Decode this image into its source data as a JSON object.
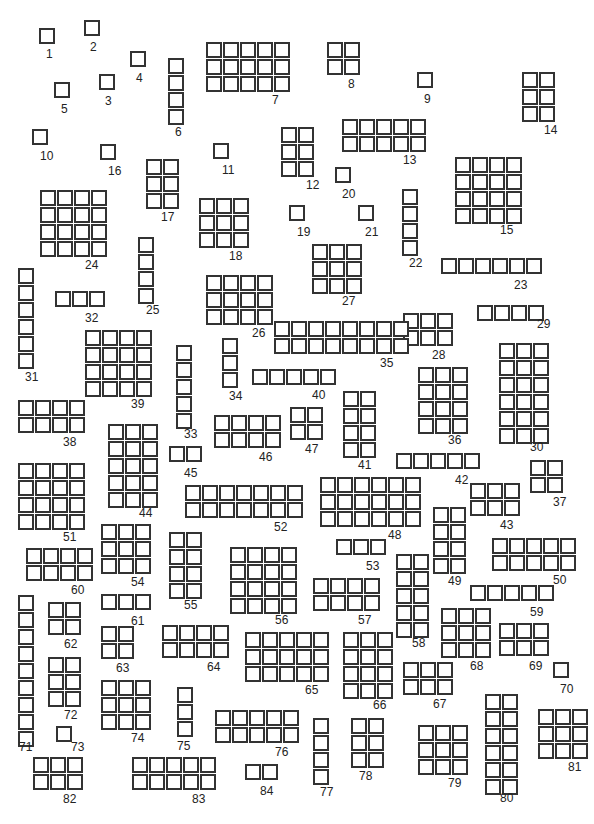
{
  "diagram": {
    "title": "",
    "cell_color": "#333333",
    "groups": [
      {
        "id": "1",
        "x": 39,
        "y": 28,
        "rows": 1,
        "cols": 1,
        "lx": 46,
        "ly": 48
      },
      {
        "id": "2",
        "x": 84,
        "y": 20,
        "rows": 1,
        "cols": 1,
        "lx": 90,
        "ly": 41
      },
      {
        "id": "3",
        "x": 99,
        "y": 74,
        "rows": 1,
        "cols": 1,
        "lx": 105,
        "ly": 95
      },
      {
        "id": "4",
        "x": 130,
        "y": 51,
        "rows": 1,
        "cols": 1,
        "lx": 136,
        "ly": 72
      },
      {
        "id": "5",
        "x": 54,
        "y": 82,
        "rows": 1,
        "cols": 1,
        "lx": 61,
        "ly": 103
      },
      {
        "id": "6",
        "x": 168,
        "y": 58,
        "rows": 4,
        "cols": 1,
        "lx": 175,
        "ly": 126
      },
      {
        "id": "7",
        "x": 206,
        "y": 42,
        "rows": 3,
        "cols": 5,
        "lx": 272,
        "ly": 94
      },
      {
        "id": "8",
        "x": 327,
        "y": 42,
        "rows": 2,
        "cols": 2,
        "lx": 348,
        "ly": 78
      },
      {
        "id": "9",
        "x": 417,
        "y": 72,
        "rows": 1,
        "cols": 1,
        "lx": 424,
        "ly": 93
      },
      {
        "id": "10",
        "x": 32,
        "y": 129,
        "rows": 1,
        "cols": 1,
        "lx": 40,
        "ly": 150
      },
      {
        "id": "11",
        "x": 213,
        "y": 143,
        "rows": 1,
        "cols": 1,
        "lx": 222,
        "ly": 164
      },
      {
        "id": "12",
        "x": 281,
        "y": 127,
        "rows": 3,
        "cols": 2,
        "lx": 306,
        "ly": 179
      },
      {
        "id": "13",
        "x": 342,
        "y": 119,
        "rows": 2,
        "cols": 5,
        "lx": 403,
        "ly": 154
      },
      {
        "id": "14",
        "x": 522,
        "y": 72,
        "rows": 3,
        "cols": 2,
        "lx": 544,
        "ly": 124
      },
      {
        "id": "15",
        "x": 455,
        "y": 157,
        "rows": 4,
        "cols": 4,
        "lx": 500,
        "ly": 224
      },
      {
        "id": "16",
        "x": 100,
        "y": 144,
        "rows": 1,
        "cols": 1,
        "lx": 108,
        "ly": 165
      },
      {
        "id": "17",
        "x": 146,
        "y": 159,
        "rows": 3,
        "cols": 2,
        "lx": 161,
        "ly": 211
      },
      {
        "id": "18",
        "x": 199,
        "y": 198,
        "rows": 3,
        "cols": 3,
        "lx": 229,
        "ly": 250
      },
      {
        "id": "19",
        "x": 289,
        "y": 205,
        "rows": 1,
        "cols": 1,
        "lx": 297,
        "ly": 226
      },
      {
        "id": "20",
        "x": 335,
        "y": 167,
        "rows": 1,
        "cols": 1,
        "lx": 342,
        "ly": 188
      },
      {
        "id": "21",
        "x": 358,
        "y": 205,
        "rows": 1,
        "cols": 1,
        "lx": 365,
        "ly": 226
      },
      {
        "id": "22",
        "x": 402,
        "y": 189,
        "rows": 4,
        "cols": 1,
        "lx": 409,
        "ly": 257
      },
      {
        "id": "23",
        "x": 441,
        "y": 258,
        "rows": 1,
        "cols": 6,
        "lx": 514,
        "ly": 279
      },
      {
        "id": "24",
        "x": 40,
        "y": 190,
        "rows": 4,
        "cols": 4,
        "lx": 85,
        "ly": 259
      },
      {
        "id": "25",
        "x": 138,
        "y": 237,
        "rows": 4,
        "cols": 1,
        "lx": 146,
        "ly": 304
      },
      {
        "id": "26",
        "x": 206,
        "y": 275,
        "rows": 3,
        "cols": 4,
        "lx": 252,
        "ly": 327
      },
      {
        "id": "27",
        "x": 312,
        "y": 244,
        "rows": 3,
        "cols": 3,
        "lx": 342,
        "ly": 295
      },
      {
        "id": "28",
        "x": 403,
        "y": 313,
        "rows": 2,
        "cols": 3,
        "lx": 432,
        "ly": 349
      },
      {
        "id": "29",
        "x": 477,
        "y": 305,
        "rows": 1,
        "cols": 4,
        "lx": 537,
        "ly": 318
      },
      {
        "id": "30",
        "x": 499,
        "y": 343,
        "rows": 6,
        "cols": 3,
        "lx": 530,
        "ly": 441
      },
      {
        "id": "31",
        "x": 18,
        "y": 268,
        "rows": 6,
        "cols": 1,
        "lx": 25,
        "ly": 371
      },
      {
        "id": "32",
        "x": 55,
        "y": 291,
        "rows": 1,
        "cols": 3,
        "lx": 85,
        "ly": 312
      },
      {
        "id": "33",
        "x": 176,
        "y": 345,
        "rows": 5,
        "cols": 1,
        "lx": 184,
        "ly": 428
      },
      {
        "id": "34",
        "x": 222,
        "y": 338,
        "rows": 3,
        "cols": 1,
        "lx": 229,
        "ly": 390
      },
      {
        "id": "35",
        "x": 274,
        "y": 321,
        "rows": 2,
        "cols": 8,
        "lx": 380,
        "ly": 357
      },
      {
        "id": "36",
        "x": 418,
        "y": 367,
        "rows": 4,
        "cols": 3,
        "lx": 448,
        "ly": 434
      },
      {
        "id": "37",
        "x": 530,
        "y": 460,
        "rows": 2,
        "cols": 2,
        "lx": 553,
        "ly": 496
      },
      {
        "id": "38",
        "x": 18,
        "y": 400,
        "rows": 2,
        "cols": 4,
        "lx": 63,
        "ly": 436
      },
      {
        "id": "39",
        "x": 85,
        "y": 330,
        "rows": 4,
        "cols": 4,
        "lx": 131,
        "ly": 398
      },
      {
        "id": "40",
        "x": 252,
        "y": 369,
        "rows": 1,
        "cols": 5,
        "lx": 312,
        "ly": 389
      },
      {
        "id": "41",
        "x": 343,
        "y": 391,
        "rows": 4,
        "cols": 2,
        "lx": 358,
        "ly": 459
      },
      {
        "id": "42",
        "x": 396,
        "y": 453,
        "rows": 1,
        "cols": 5,
        "lx": 455,
        "ly": 474
      },
      {
        "id": "43",
        "x": 470,
        "y": 483,
        "rows": 2,
        "cols": 3,
        "lx": 500,
        "ly": 519
      },
      {
        "id": "44",
        "x": 108,
        "y": 424,
        "rows": 5,
        "cols": 3,
        "lx": 139,
        "ly": 507
      },
      {
        "id": "45",
        "x": 169,
        "y": 446,
        "rows": 1,
        "cols": 2,
        "lx": 184,
        "ly": 467
      },
      {
        "id": "46",
        "x": 214,
        "y": 415,
        "rows": 2,
        "cols": 4,
        "lx": 259,
        "ly": 451
      },
      {
        "id": "47",
        "x": 290,
        "y": 407,
        "rows": 2,
        "cols": 2,
        "lx": 305,
        "ly": 443
      },
      {
        "id": "48",
        "x": 320,
        "y": 477,
        "rows": 3,
        "cols": 6,
        "lx": 388,
        "ly": 529
      },
      {
        "id": "49",
        "x": 433,
        "y": 507,
        "rows": 4,
        "cols": 2,
        "lx": 448,
        "ly": 575
      },
      {
        "id": "50",
        "x": 492,
        "y": 538,
        "rows": 2,
        "cols": 5,
        "lx": 553,
        "ly": 574
      },
      {
        "id": "51",
        "x": 18,
        "y": 463,
        "rows": 4,
        "cols": 4,
        "lx": 63,
        "ly": 531
      },
      {
        "id": "52",
        "x": 185,
        "y": 485,
        "rows": 2,
        "cols": 7,
        "lx": 274,
        "ly": 521
      },
      {
        "id": "53",
        "x": 336,
        "y": 539,
        "rows": 1,
        "cols": 3,
        "lx": 366,
        "ly": 560
      },
      {
        "id": "54",
        "x": 101,
        "y": 524,
        "rows": 3,
        "cols": 3,
        "lx": 131,
        "ly": 576
      },
      {
        "id": "55",
        "x": 169,
        "y": 532,
        "rows": 4,
        "cols": 2,
        "lx": 184,
        "ly": 599
      },
      {
        "id": "56",
        "x": 230,
        "y": 547,
        "rows": 4,
        "cols": 4,
        "lx": 275,
        "ly": 614
      },
      {
        "id": "57",
        "x": 313,
        "y": 578,
        "rows": 2,
        "cols": 4,
        "lx": 358,
        "ly": 614
      },
      {
        "id": "58",
        "x": 396,
        "y": 554,
        "rows": 5,
        "cols": 2,
        "lx": 412,
        "ly": 637
      },
      {
        "id": "59",
        "x": 470,
        "y": 585,
        "rows": 1,
        "cols": 5,
        "lx": 530,
        "ly": 606
      },
      {
        "id": "60",
        "x": 26,
        "y": 548,
        "rows": 2,
        "cols": 4,
        "lx": 71,
        "ly": 584
      },
      {
        "id": "61",
        "x": 101,
        "y": 594,
        "rows": 1,
        "cols": 3,
        "lx": 131,
        "ly": 615
      },
      {
        "id": "62",
        "x": 48,
        "y": 602,
        "rows": 2,
        "cols": 2,
        "lx": 64,
        "ly": 638
      },
      {
        "id": "63",
        "x": 101,
        "y": 626,
        "rows": 2,
        "cols": 2,
        "lx": 116,
        "ly": 662
      },
      {
        "id": "64",
        "x": 162,
        "y": 625,
        "rows": 2,
        "cols": 4,
        "lx": 207,
        "ly": 661
      },
      {
        "id": "65",
        "x": 245,
        "y": 632,
        "rows": 3,
        "cols": 5,
        "lx": 305,
        "ly": 684
      },
      {
        "id": "66",
        "x": 343,
        "y": 632,
        "rows": 4,
        "cols": 3,
        "lx": 373,
        "ly": 699
      },
      {
        "id": "67",
        "x": 403,
        "y": 662,
        "rows": 2,
        "cols": 3,
        "lx": 433,
        "ly": 698
      },
      {
        "id": "68",
        "x": 441,
        "y": 608,
        "rows": 3,
        "cols": 3,
        "lx": 470,
        "ly": 660
      },
      {
        "id": "69",
        "x": 499,
        "y": 623,
        "rows": 2,
        "cols": 3,
        "lx": 529,
        "ly": 660
      },
      {
        "id": "70",
        "x": 553,
        "y": 662,
        "rows": 1,
        "cols": 1,
        "lx": 560,
        "ly": 683
      },
      {
        "id": "71",
        "x": 18,
        "y": 595,
        "rows": 9,
        "cols": 1,
        "lx": 19,
        "ly": 741
      },
      {
        "id": "72",
        "x": 48,
        "y": 657,
        "rows": 3,
        "cols": 2,
        "lx": 64,
        "ly": 709
      },
      {
        "id": "73",
        "x": 56,
        "y": 726,
        "rows": 1,
        "cols": 1,
        "lx": 71,
        "ly": 741
      },
      {
        "id": "74",
        "x": 101,
        "y": 680,
        "rows": 3,
        "cols": 3,
        "lx": 131,
        "ly": 732
      },
      {
        "id": "75",
        "x": 177,
        "y": 687,
        "rows": 3,
        "cols": 1,
        "lx": 177,
        "ly": 740
      },
      {
        "id": "76",
        "x": 215,
        "y": 710,
        "rows": 2,
        "cols": 5,
        "lx": 275,
        "ly": 746
      },
      {
        "id": "77",
        "x": 313,
        "y": 718,
        "rows": 4,
        "cols": 1,
        "lx": 320,
        "ly": 786
      },
      {
        "id": "78",
        "x": 351,
        "y": 718,
        "rows": 3,
        "cols": 2,
        "lx": 359,
        "ly": 770
      },
      {
        "id": "79",
        "x": 418,
        "y": 725,
        "rows": 3,
        "cols": 3,
        "lx": 448,
        "ly": 777
      },
      {
        "id": "80",
        "x": 485,
        "y": 694,
        "rows": 6,
        "cols": 2,
        "lx": 500,
        "ly": 792
      },
      {
        "id": "81",
        "x": 538,
        "y": 709,
        "rows": 3,
        "cols": 3,
        "lx": 568,
        "ly": 761
      },
      {
        "id": "82",
        "x": 33,
        "y": 757,
        "rows": 2,
        "cols": 3,
        "lx": 63,
        "ly": 793
      },
      {
        "id": "83",
        "x": 132,
        "y": 757,
        "rows": 2,
        "cols": 5,
        "lx": 192,
        "ly": 793
      },
      {
        "id": "84",
        "x": 245,
        "y": 764,
        "rows": 1,
        "cols": 2,
        "lx": 260,
        "ly": 785
      }
    ]
  }
}
